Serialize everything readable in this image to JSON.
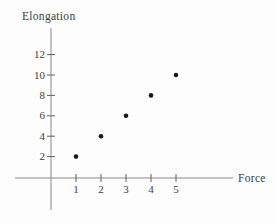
{
  "chart_data": {
    "type": "scatter",
    "title": "",
    "xlabel": "Force",
    "ylabel": "Elongation",
    "x": [
      1,
      2,
      3,
      4,
      5
    ],
    "y": [
      2,
      4,
      6,
      8,
      10
    ],
    "points": [
      [
        1,
        2
      ],
      [
        2,
        4
      ],
      [
        3,
        6
      ],
      [
        4,
        8
      ],
      [
        5,
        10
      ]
    ],
    "x_ticks": [
      1,
      2,
      3,
      4,
      5
    ],
    "y_ticks": [
      2,
      4,
      6,
      8,
      10,
      12
    ],
    "xlim": [
      0,
      7.3
    ],
    "ylim": [
      0,
      14.6
    ],
    "grid": false,
    "legend": "none",
    "colors": {
      "point": "#1a1a1a",
      "axis_line": "#8a8a8a",
      "tick_mark": "#5f5f5f",
      "text": "#3c3c3c",
      "background": "#fdfdfd"
    }
  }
}
